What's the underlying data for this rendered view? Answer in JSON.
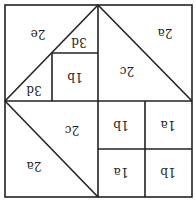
{
  "diagram": {
    "orientation": "rotated-180",
    "regions": [
      {
        "id": "tl-2e",
        "label": "2e"
      },
      {
        "id": "tl-3d-upper",
        "label": "3d"
      },
      {
        "id": "tl-3d-lower",
        "label": "3d"
      },
      {
        "id": "tl-1b",
        "label": "1b"
      },
      {
        "id": "tr-2a",
        "label": "2a"
      },
      {
        "id": "tr-2c",
        "label": "2c"
      },
      {
        "id": "bl-2c",
        "label": "2c"
      },
      {
        "id": "bl-2a",
        "label": "2a"
      },
      {
        "id": "br-1b-top-left",
        "label": "1b"
      },
      {
        "id": "br-1a-top-right",
        "label": "1a"
      },
      {
        "id": "br-1a-bottom-left",
        "label": "1a"
      },
      {
        "id": "br-1b-bottom-right",
        "label": "1b"
      }
    ]
  }
}
